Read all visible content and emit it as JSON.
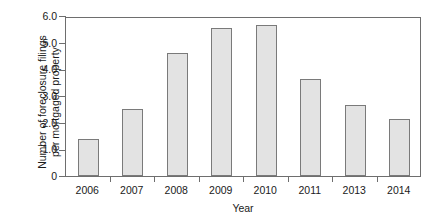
{
  "chart_data": {
    "type": "bar",
    "title": "",
    "xlabel": "Year",
    "ylabel_line1": "Number of foreclosure filings",
    "ylabel_line2": "per mortgaged property",
    "categories": [
      "2006",
      "2007",
      "2008",
      "2009",
      "2010",
      "2011",
      "2013",
      "2014"
    ],
    "values": [
      1.4,
      2.5,
      4.6,
      5.55,
      5.65,
      3.65,
      2.65,
      2.15
    ],
    "ylim": [
      0,
      6.0
    ],
    "ytick_labels": [
      "0",
      "1.0",
      "2.0",
      "3.0",
      "4.0",
      "5.0",
      "6.0"
    ],
    "ytick_values": [
      0,
      1.0,
      2.0,
      3.0,
      4.0,
      5.0,
      6.0
    ],
    "grid": false,
    "legend": "none",
    "bar_fill_color": "#e3e3e3",
    "bar_edge_color": "#7a7a7a",
    "axis_color": "#6e6e6e",
    "background_color": "#ffffff"
  }
}
